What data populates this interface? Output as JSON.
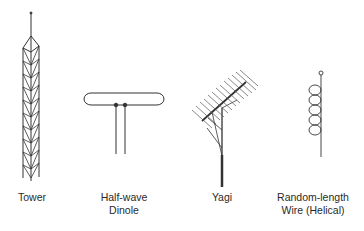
{
  "diagram": {
    "antennas": [
      {
        "id": "tower",
        "label_lines": [
          "Tower"
        ]
      },
      {
        "id": "half-wave-dipole",
        "label_lines": [
          "Half-wave",
          "Dinole"
        ]
      },
      {
        "id": "yagi",
        "label_lines": [
          "Yagi"
        ]
      },
      {
        "id": "random-length-wire",
        "label_lines": [
          "Random-length",
          "Wire (Helical)"
        ]
      }
    ],
    "colors": {
      "line": "#333333",
      "text": "#2a2a2a",
      "background": "#ffffff"
    }
  }
}
